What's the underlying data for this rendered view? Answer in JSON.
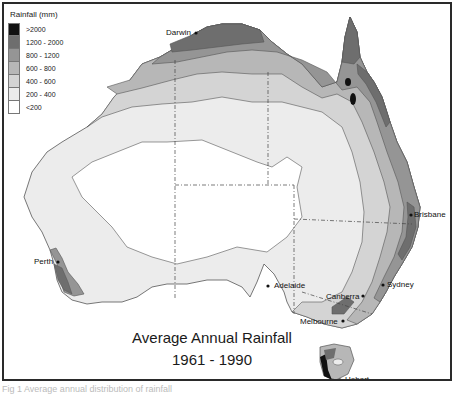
{
  "legend": {
    "title": "Rainfall (mm)",
    "classes": [
      {
        "label": ">2000",
        "color": "#111111"
      },
      {
        "label": "1200 - 2000",
        "color": "#6e6e6e"
      },
      {
        "label": "800 - 1200",
        "color": "#959595"
      },
      {
        "label": "600 - 800",
        "color": "#b7b7b7"
      },
      {
        "label": "400 - 600",
        "color": "#d4d4d4"
      },
      {
        "label": "200 - 400",
        "color": "#ececec"
      },
      {
        "label": "<200",
        "color": "#ffffff"
      }
    ]
  },
  "cities": [
    {
      "name": "Darwin",
      "x": 194,
      "y": 31
    },
    {
      "name": "Brisbane",
      "x": 409,
      "y": 213
    },
    {
      "name": "Sydney",
      "x": 381,
      "y": 283
    },
    {
      "name": "Canberra",
      "x": 361,
      "y": 294
    },
    {
      "name": "Melbourne",
      "x": 341,
      "y": 319
    },
    {
      "name": "Adelaide",
      "x": 266,
      "y": 284
    },
    {
      "name": "Perth",
      "x": 56,
      "y": 260
    },
    {
      "name": "Hobart",
      "x": 338,
      "y": 378
    }
  ],
  "title": {
    "line1": "Average Annual Rainfall",
    "line2": "1961 - 1990"
  },
  "caption": "Fig 1  Average annual distribution of rainfall"
}
